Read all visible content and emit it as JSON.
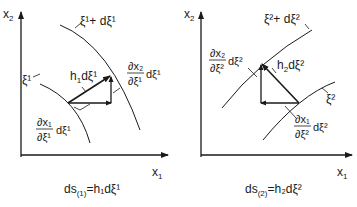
{
  "panels": [
    {
      "id": "left",
      "axis_y_label": "x",
      "axis_y_sub": "2",
      "axis_x_label": "x",
      "axis_x_sub": "1",
      "curve_inner_label": "ξ¹",
      "curve_outer_label": "ξ¹+ dξ¹",
      "hyp_label_h": "h",
      "hyp_label_sub": "1",
      "hyp_label_rest": "dξ¹",
      "vert_num": "∂x₂",
      "vert_den": "∂ξ¹",
      "vert_tail": "dξ¹",
      "horiz_num": "∂x₁",
      "horiz_den": "∂ξ¹",
      "horiz_tail": "dξ¹",
      "formula_lhs": "ds",
      "formula_sub": "(1)",
      "formula_rhs": "=h₁dξ¹"
    },
    {
      "id": "right",
      "axis_y_label": "x",
      "axis_y_sub": "2",
      "axis_x_label": "x",
      "axis_x_sub": "1",
      "curve_inner_label": "ξ²",
      "curve_outer_label": "ξ²+ dξ²",
      "hyp_label_h": "h",
      "hyp_label_sub": "2",
      "hyp_label_rest": "dξ²",
      "vert_num": "∂x₂",
      "vert_den": "∂ξ²",
      "vert_tail": "dξ²",
      "horiz_num": "∂x₁",
      "horiz_den": "∂ξ²",
      "horiz_tail": "dξ²",
      "formula_lhs": "ds",
      "formula_sub": "(2)",
      "formula_rhs": "=h₂dξ²"
    }
  ],
  "colors": {
    "ink": "#1a1a1a",
    "background": "#ffffff"
  }
}
